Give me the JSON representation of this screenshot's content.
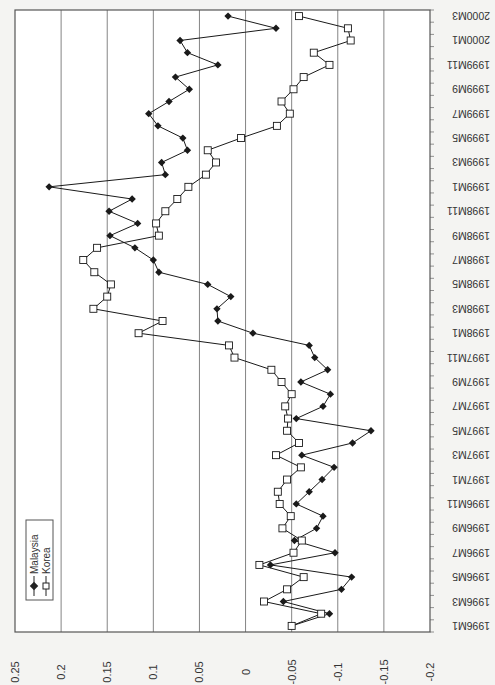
{
  "chart_data": {
    "type": "line",
    "orientation": "rotated-90-clockwise",
    "title": "",
    "xlabel": "",
    "ylabel": "",
    "ylim": [
      -0.2,
      0.25
    ],
    "yticks": [
      0.25,
      0.2,
      0.15,
      0.1,
      0.05,
      0,
      -0.05,
      -0.1,
      -0.15,
      -0.2
    ],
    "ytick_labels": [
      "0.25",
      "0.2",
      "0.15",
      "0.1",
      "0.05",
      "0",
      "-0.05",
      "-0.1",
      "-0.15",
      "-0.2"
    ],
    "grid": true,
    "legend_position": "bottom-left",
    "categories": [
      "1996M1",
      "1996M2",
      "1996M3",
      "1996M4",
      "1996M5",
      "1996M6",
      "1996M7",
      "1996M8",
      "1996M9",
      "1996M10",
      "1996M11",
      "1996M12",
      "1997M1",
      "1997M2",
      "1997M3",
      "1997M4",
      "1997M5",
      "1997M6",
      "1997M7",
      "1997M8",
      "1997M9",
      "1997M10",
      "1997M11",
      "1997M12",
      "1998M1",
      "1998M2",
      "1998M3",
      "1998M4",
      "1998M5",
      "1998M6",
      "1998M7",
      "1998M8",
      "1998M9",
      "1998M10",
      "1998M11",
      "1998M12",
      "1999M1",
      "1999M2",
      "1999M3",
      "1999M4",
      "1999M5",
      "1999M6",
      "1999M7",
      "1999M8",
      "1999M9",
      "1999M10",
      "1999M11",
      "1999M12",
      "2000M1",
      "2000M2",
      "2000M3"
    ],
    "xtick_labels": [
      "1996M1",
      "1996M3",
      "1996M5",
      "1996M7",
      "1996M9",
      "1996M11",
      "1997M1",
      "1997M3",
      "1997M5",
      "1997M7",
      "1997M9",
      "1997M11",
      "1998M1",
      "1998M3",
      "1998M5",
      "1998M7",
      "1998M9",
      "1998M11",
      "1999M1",
      "1999M3",
      "1999M5",
      "1999M7",
      "1999M9",
      "1999M11",
      "2000M1",
      "2000M3"
    ],
    "series": [
      {
        "name": "Malaysia",
        "marker": "filled-diamond",
        "color": "#1a1a1a",
        "values": [
          -0.05,
          -0.091,
          -0.041,
          -0.104,
          -0.115,
          -0.027,
          -0.097,
          -0.053,
          -0.077,
          -0.084,
          -0.055,
          -0.069,
          -0.083,
          -0.096,
          -0.061,
          -0.116,
          -0.136,
          -0.055,
          -0.084,
          -0.092,
          -0.06,
          -0.089,
          -0.075,
          -0.069,
          -0.008,
          0.03,
          0.031,
          0.016,
          0.041,
          0.094,
          0.1,
          0.12,
          0.147,
          0.117,
          0.148,
          0.123,
          0.213,
          0.087,
          0.091,
          0.063,
          0.068,
          0.095,
          0.105,
          0.083,
          0.061,
          0.076,
          0.03,
          0.063,
          0.071,
          -0.033,
          0.019
        ]
      },
      {
        "name": "Korea",
        "marker": "hollow-square",
        "color": "#1a1a1a",
        "values": [
          -0.05,
          -0.082,
          -0.02,
          -0.045,
          -0.063,
          -0.015,
          -0.052,
          -0.061,
          -0.04,
          -0.049,
          -0.037,
          -0.035,
          -0.045,
          -0.06,
          -0.033,
          -0.058,
          -0.045,
          -0.046,
          -0.043,
          -0.05,
          -0.039,
          -0.028,
          0.012,
          0.018,
          0.116,
          0.09,
          0.165,
          0.15,
          0.146,
          0.164,
          0.176,
          0.161,
          0.094,
          0.097,
          0.087,
          0.074,
          0.062,
          0.043,
          0.032,
          0.041,
          0.005,
          -0.034,
          -0.048,
          -0.039,
          -0.052,
          -0.063,
          -0.091,
          -0.074,
          -0.114,
          -0.111,
          -0.058
        ]
      }
    ]
  }
}
